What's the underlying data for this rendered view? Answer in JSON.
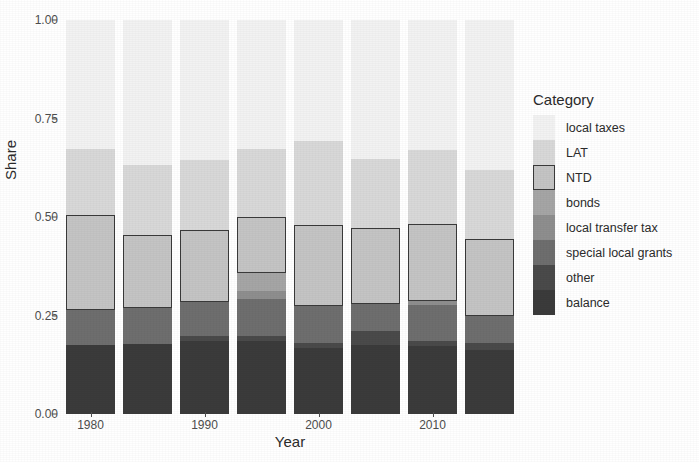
{
  "chart_data": {
    "type": "bar",
    "subtype": "stacked-bar",
    "title": "",
    "xlabel": "Year",
    "ylabel": "Share",
    "ylim": [
      0.0,
      1.0
    ],
    "yticks": [
      0.0,
      0.25,
      0.5,
      0.75,
      1.0
    ],
    "ytick_labels": [
      "0.00",
      "0.25",
      "0.50",
      "0.75",
      "1.00"
    ],
    "xticks": [
      1980,
      1990,
      2000,
      2010
    ],
    "xtick_labels": [
      "1980",
      "1990",
      "2000",
      "2010"
    ],
    "grid": false,
    "legend_position": "right",
    "legend_title": "Category",
    "categories": [
      "1980",
      "1985",
      "1990",
      "1995",
      "2000",
      "2005",
      "2010",
      "2015"
    ],
    "stack_order_bottom_to_top": [
      "balance",
      "other",
      "special local grants",
      "local transfer tax",
      "bonds",
      "NTD",
      "LAT",
      "local taxes"
    ],
    "series": [
      {
        "name": "balance",
        "color": "#3b3b3b",
        "values": [
          0.175,
          0.178,
          0.186,
          0.186,
          0.168,
          0.176,
          0.173,
          0.163
        ]
      },
      {
        "name": "other",
        "color": "#4a4a4a",
        "values": [
          0.0,
          0.0,
          0.012,
          0.013,
          0.013,
          0.034,
          0.013,
          0.016
        ]
      },
      {
        "name": "special local grants",
        "color": "#6e6e6e",
        "values": [
          0.088,
          0.09,
          0.085,
          0.093,
          0.093,
          0.07,
          0.09,
          0.07
        ]
      },
      {
        "name": "local transfer tax",
        "color": "#8e8e8e",
        "values": [
          0.0,
          0.0,
          0.0,
          0.02,
          0.0,
          0.0,
          0.01,
          0.0
        ]
      },
      {
        "name": "bonds",
        "color": "#a5a5a5",
        "values": [
          0.0,
          0.0,
          0.0,
          0.046,
          0.0,
          0.0,
          0.0,
          0.0
        ]
      },
      {
        "name": "NTD",
        "color": "#c4c4c4",
        "values": [
          0.241,
          0.187,
          0.184,
          0.143,
          0.205,
          0.192,
          0.197,
          0.195
        ]
      },
      {
        "name": "LAT",
        "color": "#d8d8d8",
        "values": [
          0.168,
          0.176,
          0.178,
          0.171,
          0.215,
          0.176,
          0.186,
          0.175
        ]
      },
      {
        "name": "local taxes",
        "color": "#f2f2f2",
        "values": [
          0.328,
          0.369,
          0.355,
          0.328,
          0.306,
          0.352,
          0.331,
          0.381
        ]
      }
    ]
  },
  "axis": {
    "y_title": "Share",
    "x_title": "Year"
  },
  "legend": {
    "title": "Category",
    "items": [
      {
        "label": "local taxes",
        "color": "#f2f2f2",
        "outlined": false
      },
      {
        "label": "LAT",
        "color": "#d8d8d8",
        "outlined": false
      },
      {
        "label": "NTD",
        "color": "#c4c4c4",
        "outlined": true
      },
      {
        "label": "bonds",
        "color": "#a5a5a5",
        "outlined": false
      },
      {
        "label": "local transfer tax",
        "color": "#8e8e8e",
        "outlined": false
      },
      {
        "label": "special local grants",
        "color": "#6e6e6e",
        "outlined": false
      },
      {
        "label": "other",
        "color": "#4a4a4a",
        "outlined": false
      },
      {
        "label": "balance",
        "color": "#3b3b3b",
        "outlined": false
      }
    ]
  },
  "colors": {
    "axis_text": "#4d4d4d",
    "title_text": "#2b2b2b",
    "ntd_outline": "#3a3a3a",
    "panel_background": "#ffffff"
  }
}
